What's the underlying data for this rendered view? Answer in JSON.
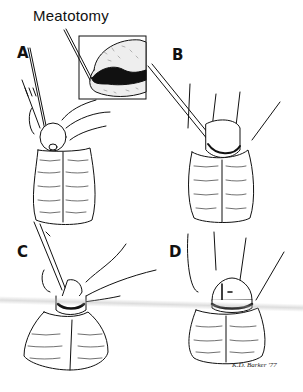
{
  "figure": {
    "title": "Meatotomy",
    "panels": [
      {
        "label": "A"
      },
      {
        "label": "B"
      },
      {
        "label": "C"
      },
      {
        "label": "D"
      }
    ],
    "signature": "K.D. Barker '77"
  }
}
